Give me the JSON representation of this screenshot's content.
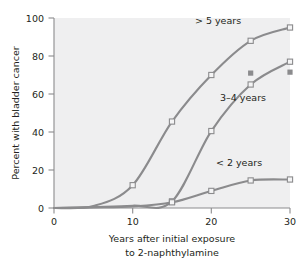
{
  "chart_data": {
    "type": "line",
    "title": "",
    "xlabel": "Years after initial exposure to 2-naphthylamine",
    "xlabel_line1": "Years after initial exposure",
    "xlabel_line2": "to 2-naphthylamine",
    "ylabel": "Percent with bladder cancer",
    "xlim": [
      0,
      30
    ],
    "ylim": [
      0,
      100
    ],
    "xticks": [
      0,
      10,
      20,
      30
    ],
    "xtick_labels": [
      "0",
      "10",
      "20",
      "30"
    ],
    "yticks": [
      0,
      20,
      40,
      60,
      80,
      100
    ],
    "ytick_labels": [
      "0",
      "20",
      "40",
      "60",
      "80",
      "100"
    ],
    "grid": false,
    "legend_position": "inline-annotations",
    "plot_background": "#efeff0",
    "line_color": "#8b8b8d",
    "marker_open_fill": "#f4f4f5",
    "marker_filled_fill": "#8b8b8d",
    "series": [
      {
        "name": "> 5 years",
        "label": "> 5 years",
        "marker": "open-square",
        "x": [
          0,
          5,
          10,
          15,
          20,
          25,
          30
        ],
        "values": [
          0,
          1,
          12,
          45.5,
          70,
          88,
          95
        ],
        "marker_x": [
          10,
          15,
          20,
          25,
          30
        ],
        "marker_values": [
          12,
          45.5,
          70,
          88,
          95
        ]
      },
      {
        "name": "3-4 years",
        "label": "3–4 years",
        "marker": "open-square",
        "x": [
          0,
          5,
          10,
          15,
          20,
          25,
          30
        ],
        "values": [
          0,
          0.5,
          1.2,
          3.5,
          40.5,
          65,
          77
        ],
        "marker_x": [
          15,
          20,
          25,
          30
        ],
        "marker_values": [
          3.5,
          40.5,
          65,
          77
        ]
      },
      {
        "name": "< 2 years",
        "label": "< 2 years",
        "marker": "open-square",
        "x": [
          0,
          5,
          10,
          15,
          20,
          25,
          30
        ],
        "values": [
          0,
          0.3,
          0.8,
          3,
          9,
          14.5,
          15
        ],
        "marker_x": [
          15,
          20,
          25,
          30
        ],
        "marker_values": [
          3,
          9,
          14.5,
          15
        ]
      }
    ],
    "extra_points": {
      "name": "filled-squares",
      "marker": "filled-square",
      "x": [
        25,
        30
      ],
      "values": [
        71,
        71.5
      ]
    },
    "annotations": [
      {
        "text": "> 5 years",
        "x": 21.0,
        "y": 98.0
      },
      {
        "text": "3–4 years",
        "x": 24.0,
        "y": 56.5
      },
      {
        "text": "< 2 years",
        "x": 23.5,
        "y": 24.0
      }
    ]
  }
}
